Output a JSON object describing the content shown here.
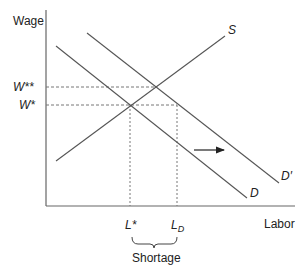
{
  "diagram": {
    "y_axis_label": "Wage",
    "x_axis_label": "Labor",
    "curves": {
      "supply": "S",
      "demand": "D",
      "demand_shifted": "D′"
    },
    "wage_levels": {
      "w_star": "W*",
      "w_double_star": "W**"
    },
    "labor_levels": {
      "l_star": "L*",
      "l_d_base": "L",
      "l_d_sub": "D"
    },
    "brace_label": "Shortage",
    "colors": {
      "line": "#555555",
      "dashed": "#777777",
      "text": "#222222"
    }
  }
}
